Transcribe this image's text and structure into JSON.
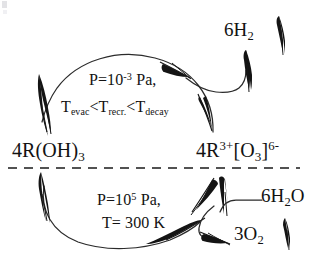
{
  "diagram": {
    "axis": {
      "name": "phase-boundary-dashed-line"
    },
    "species": {
      "left": {
        "id": "4R(OH)3",
        "prefix": "4R(OH)",
        "subscript": "3"
      },
      "right": {
        "id": "4R3+[O3]6-",
        "prefix": "4R",
        "charge": "3+",
        "bracket_open": "[O",
        "bracket_sub": "3",
        "bracket_close": "]",
        "bracket_charge": "6-"
      }
    },
    "products": {
      "hydrogen": {
        "coefficient_formula": "6H",
        "subscript": "2",
        "arrow": "up-arrow-gas"
      },
      "oxygen": {
        "coefficient_formula": "3O",
        "subscript": "2",
        "arrow": "up-arrow-gas"
      },
      "water": {
        "coefficient_formula": "6H",
        "subscript": "2",
        "suffix": "O"
      }
    },
    "top_conditions": {
      "line1_prefix": "P=10",
      "line1_exponent": "-3",
      "line1_suffix": " Pa,",
      "line2_t1": "T",
      "line2_t1_sub": "evac",
      "line2_op1": "<",
      "line2_t2": "T",
      "line2_t2_sub": "recr.",
      "line2_op2": "<",
      "line2_t3": "T",
      "line2_t3_sub": "decay"
    },
    "bottom_conditions": {
      "line1_prefix": "P=10",
      "line1_exponent": "5",
      "line1_suffix": " Pa,",
      "line2": "T= 300 K"
    },
    "colors": {
      "ink": "#121212",
      "background": "#ffffff",
      "dashes": "#1a1a1a"
    }
  }
}
